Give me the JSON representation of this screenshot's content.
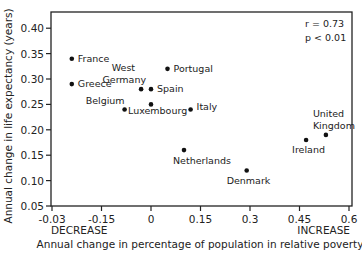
{
  "chart_data": {
    "type": "scatter",
    "title": "",
    "xlabel": "Annual change in percentage of population in relative poverty",
    "ylabel": "Annual change in life expectancy (years)",
    "x_ticks": [
      "-0.03",
      "-0.15",
      "0",
      "0.15",
      "0.3",
      "0.45",
      "0.6"
    ],
    "x_tick_values": [
      -0.3,
      -0.15,
      0,
      0.15,
      0.3,
      0.45,
      0.6
    ],
    "y_ticks": [
      "0.05",
      "0.10",
      "0.15",
      "0.20",
      "0.25",
      "0.30",
      "0.35",
      "0.40"
    ],
    "y_tick_values": [
      0.05,
      0.1,
      0.15,
      0.2,
      0.25,
      0.3,
      0.35,
      0.4
    ],
    "xlim": [
      -0.3,
      0.61
    ],
    "ylim": [
      0.05,
      0.44
    ],
    "grid": false,
    "annotations": {
      "stats_line1": "r = 0.73",
      "stats_line2": "p < 0.01",
      "x_left_note": "DECREASE",
      "x_right_note": "INCREASE"
    },
    "points": [
      {
        "label": "France",
        "x": -0.24,
        "y": 0.34,
        "lx": 6,
        "ly": 3,
        "anchor": "start"
      },
      {
        "label": "Greece",
        "x": -0.24,
        "y": 0.29,
        "lx": 6,
        "ly": 3,
        "anchor": "start"
      },
      {
        "label": "West",
        "x": -0.03,
        "y": 0.28,
        "lx": -6,
        "ly": -18,
        "anchor": "end"
      },
      {
        "label": "Germany",
        "x": -0.03,
        "y": 0.28,
        "lx": 5,
        "ly": -6,
        "anchor": "end"
      },
      {
        "label": "Spain",
        "x": 0.0,
        "y": 0.28,
        "lx": 6,
        "ly": 3,
        "anchor": "start"
      },
      {
        "label": "Belgium",
        "x": -0.08,
        "y": 0.24,
        "lx": 0,
        "ly": -5,
        "anchor": "end"
      },
      {
        "label": "Luxembourg",
        "x": 0.0,
        "y": 0.25,
        "lx": -23,
        "ly": 10,
        "anchor": "start"
      },
      {
        "label": "Portugal",
        "x": 0.05,
        "y": 0.32,
        "lx": 6,
        "ly": 3,
        "anchor": "start"
      },
      {
        "label": "Italy",
        "x": 0.12,
        "y": 0.24,
        "lx": 6,
        "ly": 1,
        "anchor": "start"
      },
      {
        "label": "Netherlands",
        "x": 0.1,
        "y": 0.16,
        "lx": -11,
        "ly": 14,
        "anchor": "start"
      },
      {
        "label": "Denmark",
        "x": 0.29,
        "y": 0.12,
        "lx": -20,
        "ly": 14,
        "anchor": "start"
      },
      {
        "label": "Ireland",
        "x": 0.47,
        "y": 0.18,
        "lx": -14,
        "ly": 13,
        "anchor": "start"
      },
      {
        "label": "United",
        "x": 0.53,
        "y": 0.19,
        "lx": -13,
        "ly": -18,
        "anchor": "start"
      },
      {
        "label": "Kingdom",
        "x": 0.53,
        "y": 0.19,
        "lx": -13,
        "ly": -6,
        "anchor": "start"
      }
    ]
  },
  "layout": {
    "plot_left": 51,
    "plot_right": 352,
    "plot_top": 12,
    "plot_bottom": 206,
    "x0_px": 151,
    "px_per_x": 330,
    "y005_px": 206,
    "px_per_y": 508
  }
}
